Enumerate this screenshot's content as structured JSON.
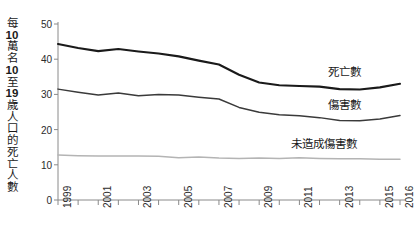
{
  "chart_data": {
    "type": "line",
    "title": "",
    "subtitle": "",
    "xlabel": "",
    "ylabel": "每10萬名10至19歲人口的死亡人數",
    "ylabel_chars": [
      "每",
      "10",
      "萬",
      "名",
      "10",
      "至",
      "19",
      "歲",
      "人",
      "口",
      "的",
      "死",
      "亡",
      "人",
      "數"
    ],
    "ylabel_bold_indices": [
      1,
      4,
      6
    ],
    "xlim": [
      1999,
      2016
    ],
    "ylim": [
      0,
      50
    ],
    "yticks": [
      0,
      10,
      20,
      30,
      40,
      50
    ],
    "ytick_labels": [
      "0",
      "10",
      "20",
      "30",
      "40",
      "50"
    ],
    "xticks": [
      1999,
      2000,
      2001,
      2002,
      2003,
      2004,
      2005,
      2006,
      2007,
      2008,
      2009,
      2010,
      2011,
      2012,
      2013,
      2014,
      2015,
      2016
    ],
    "xtick_labels_shown": [
      "1999",
      "2001",
      "2003",
      "2005",
      "2007",
      "2009",
      "2011",
      "2013",
      "2015",
      "2016"
    ],
    "grid": false,
    "legend_position": "inline-right",
    "x": [
      1999,
      2000,
      2001,
      2002,
      2003,
      2004,
      2005,
      2006,
      2007,
      2008,
      2009,
      2010,
      2011,
      2012,
      2013,
      2014,
      2015,
      2016
    ],
    "series": [
      {
        "name": "死亡數",
        "color": "#1a1a1a",
        "width": 2.1,
        "values": [
          44.3,
          43.2,
          42.3,
          42.9,
          42.2,
          41.6,
          40.8,
          39.6,
          38.5,
          35.6,
          33.4,
          32.6,
          32.4,
          32.2,
          31.5,
          31.4,
          32.0,
          33.0
        ],
        "label_x": 2012.4,
        "label_y": 36.6
      },
      {
        "name": "傷害數",
        "color": "#3a3a3a",
        "width": 1.5,
        "values": [
          31.5,
          30.6,
          29.8,
          30.4,
          29.6,
          30.0,
          29.8,
          29.2,
          28.7,
          26.3,
          24.9,
          24.2,
          23.9,
          23.4,
          22.6,
          22.5,
          23.0,
          24.0
        ],
        "label_x": 2012.4,
        "label_y": 27.4
      },
      {
        "name": "未造成傷害數",
        "color": "#b4b4b4",
        "width": 1.5,
        "values": [
          12.8,
          12.6,
          12.5,
          12.5,
          12.5,
          12.4,
          12.0,
          12.2,
          11.9,
          11.8,
          11.9,
          11.8,
          12.0,
          11.8,
          11.7,
          11.7,
          11.6,
          11.6
        ],
        "label_x": 2010.6,
        "label_y": 16.2
      }
    ]
  }
}
